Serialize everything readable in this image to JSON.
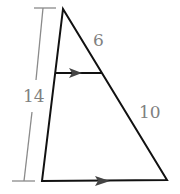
{
  "diagram": {
    "type": "triangle-proportionality",
    "labels": {
      "left_total": "14",
      "right_upper": "6",
      "right_lower": "10"
    },
    "colors": {
      "lines": "#111111",
      "dimension": "#8a8a8a",
      "labels": "#808080"
    },
    "parallel_marks": 2
  }
}
